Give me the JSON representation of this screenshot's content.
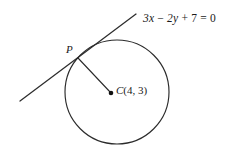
{
  "figure": {
    "kind": "geometry-diagram",
    "background_color": "#ffffff",
    "stroke_color": "#2b2b2b",
    "labels": {
      "tangent_equation": "3x − 2y + 7 = 0",
      "tangent_equation_parts": {
        "term_x": "3x",
        "operator_1": "−",
        "term_y": "2y",
        "operator_2": "+",
        "constant": "7",
        "equals": "=",
        "right_side": "0"
      },
      "tangent_point": "P",
      "center_point": "C(4, 3)",
      "center_point_parts": {
        "name": "C",
        "open_paren": "(",
        "x": "4",
        "comma": ",",
        "y": "3",
        "close_paren": ")"
      }
    },
    "geometry": {
      "circle": {
        "center_px": [
          117,
          92
        ],
        "radius_px": 52,
        "left_px": 65,
        "right_px": 169,
        "top_px": 40,
        "bottom_px": 144
      },
      "center_dot_px": [
        111,
        93
      ],
      "tangent_point_px": [
        78,
        58
      ],
      "tangent_line_px": [
        [
          20,
          101
        ],
        [
          136,
          14
        ]
      ],
      "radius_segment_px": [
        [
          78,
          58
        ],
        [
          111,
          93
        ]
      ]
    }
  }
}
